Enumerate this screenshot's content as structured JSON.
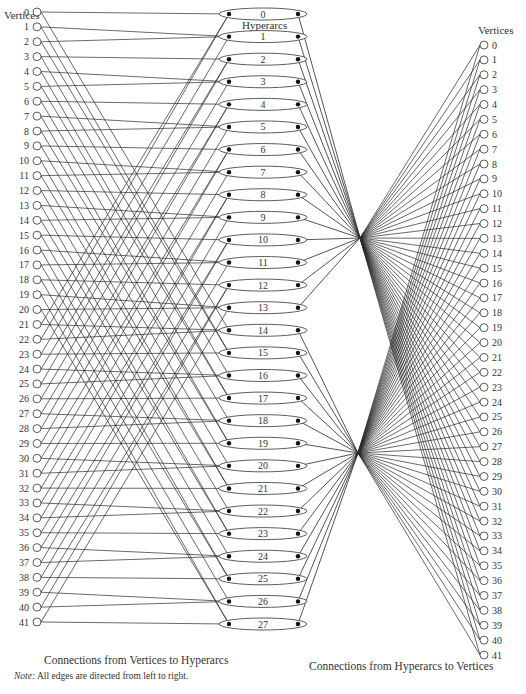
{
  "diagram": {
    "left_column_title": "Vertices",
    "middle_column_title": "Hyperarcs",
    "right_column_title": "Vertices",
    "left_caption": "Connections from Vertices to Hyperarcs",
    "right_caption": "Connections from Hyperarcs to Vertices",
    "note_label": "Note:",
    "note_text": "All edges are directed from left to right.",
    "edge_direction": "left-to-right",
    "line_color": "#2a2a2a",
    "node_stroke": "#333333",
    "dot_color": "#111111"
  },
  "left_vertices": [
    "0",
    "1",
    "2",
    "3",
    "4",
    "5",
    "6",
    "7",
    "8",
    "9",
    "10",
    "11",
    "12",
    "13",
    "14",
    "15",
    "16",
    "17",
    "18",
    "19",
    "20",
    "21",
    "22",
    "23",
    "24",
    "25",
    "26",
    "27",
    "28",
    "29",
    "30",
    "31",
    "32",
    "33",
    "34",
    "35",
    "36",
    "37",
    "38",
    "39",
    "40",
    "41"
  ],
  "hyperarcs": [
    "0",
    "1",
    "2",
    "3",
    "4",
    "5",
    "6",
    "7",
    "8",
    "9",
    "10",
    "11",
    "12",
    "13",
    "14",
    "15",
    "16",
    "17",
    "18",
    "19",
    "20",
    "21",
    "22",
    "23",
    "24",
    "25",
    "26",
    "27"
  ],
  "right_vertices": [
    "0",
    "1",
    "2",
    "3",
    "4",
    "5",
    "6",
    "7",
    "8",
    "9",
    "10",
    "11",
    "12",
    "13",
    "14",
    "15",
    "16",
    "17",
    "18",
    "19",
    "20",
    "21",
    "22",
    "23",
    "24",
    "25",
    "26",
    "27",
    "28",
    "29",
    "30",
    "31",
    "32",
    "33",
    "34",
    "35",
    "36",
    "37",
    "38",
    "39",
    "40",
    "41"
  ],
  "hub_groups": [
    {
      "name": "upper-hub",
      "hyperarcs_from": 0,
      "hyperarcs_to": 13
    },
    {
      "name": "lower-hub",
      "hyperarcs_from": 14,
      "hyperarcs_to": 27
    }
  ]
}
